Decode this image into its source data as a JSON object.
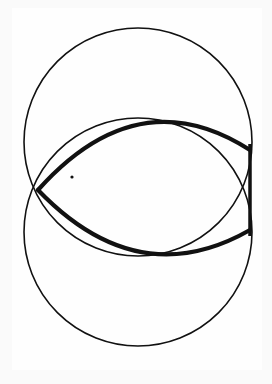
{
  "figure": {
    "title": "Vesica piscis (ichthys) construction",
    "stroke_color": "#111111",
    "background_color": "#fefefe",
    "circles": [
      {
        "name": "upper-circle",
        "cx": 138,
        "cy": 142,
        "r": 114
      },
      {
        "name": "lower-circle",
        "cx": 138,
        "cy": 232,
        "r": 114
      }
    ],
    "fish": {
      "left_tip": [
        38,
        190
      ],
      "tail_cross": [
        238,
        190
      ],
      "top_arc_peak_y": 134,
      "bottom_arc_trough_y": 242,
      "tail_x": 250,
      "tail_top_y": 144,
      "tail_bottom_y": 236
    },
    "eye": {
      "cx": 72,
      "cy": 177,
      "r": 1.6
    }
  }
}
